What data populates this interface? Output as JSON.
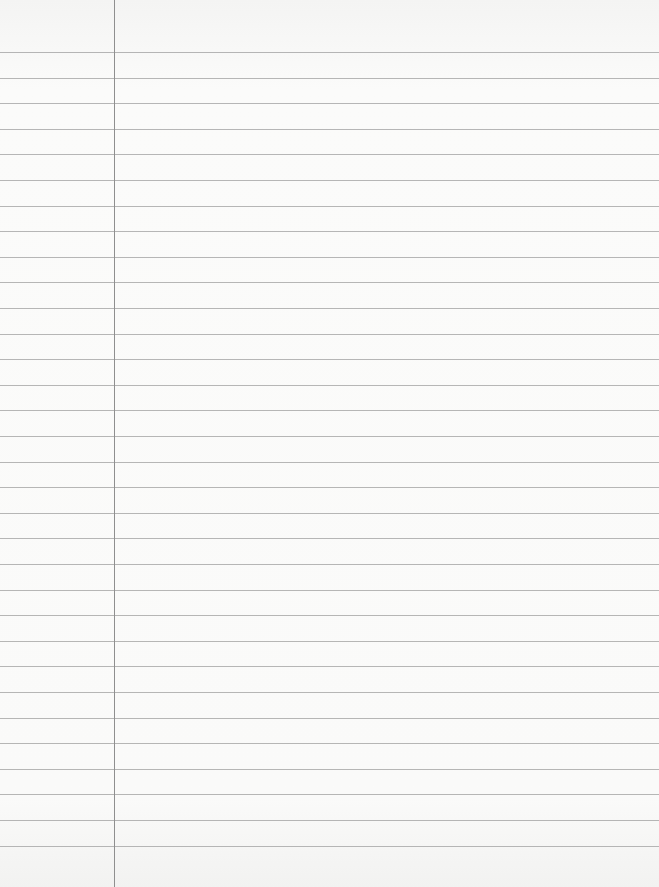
{
  "paper": {
    "type": "lined notebook paper",
    "line_color": "#a9a9a9",
    "margin_color": "#8f8f8f",
    "background": "#f9f9f8",
    "first_line_y": 52,
    "line_spacing": 25.6,
    "line_count": 32,
    "margin_x": 114
  }
}
